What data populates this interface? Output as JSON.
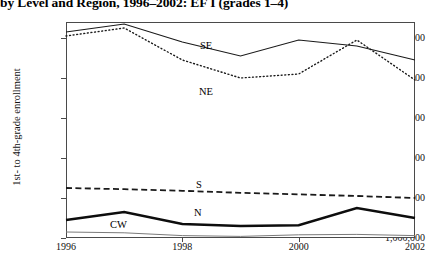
{
  "title": "by Level and Region, 1996–2002: EF I (grades 1–4)",
  "axis": {
    "ylabel": "1st- to 4th-grade enrollment",
    "xlabel": ""
  },
  "ticks": {
    "y": [
      "1,000,000",
      "2,000,000",
      "3,000,000",
      "4,000,000",
      "5,000,000",
      "6,000,000"
    ],
    "x": [
      "1996",
      "1998",
      "2000",
      "2002"
    ]
  },
  "series_labels": {
    "se": "SE",
    "ne": "NE",
    "s": "S",
    "n": "N",
    "cw": "CW"
  },
  "chart_data": {
    "type": "line",
    "title": "by Level and Region, 1996–2002: EF I (grades 1–4)",
    "xlabel": "",
    "ylabel": "1st- to 4th-grade enrollment",
    "x": [
      1996,
      1997,
      1998,
      1999,
      2000,
      2001,
      2002
    ],
    "xlim": [
      1996,
      2002
    ],
    "ylim": [
      1000000,
      6400000
    ],
    "xticks": [
      1996,
      1998,
      2000,
      2002
    ],
    "yticks": [
      1000000,
      2000000,
      3000000,
      4000000,
      5000000,
      6000000
    ],
    "grid": false,
    "legend": "inline-labels",
    "series": [
      {
        "name": "SE",
        "style": "solid",
        "color": "#1a1a1a",
        "width": 1.2,
        "values": [
          6150000,
          6350000,
          5900000,
          5550000,
          5950000,
          5800000,
          5450000
        ]
      },
      {
        "name": "NE",
        "style": "dotted",
        "color": "#1a1a1a",
        "width": 1.4,
        "values": [
          6050000,
          6250000,
          5450000,
          5000000,
          5100000,
          5950000,
          4950000
        ]
      },
      {
        "name": "S",
        "style": "dashed",
        "color": "#1a1a1a",
        "width": 1.8,
        "values": [
          2250000,
          2220000,
          2180000,
          2130000,
          2090000,
          2050000,
          2000000
        ]
      },
      {
        "name": "N",
        "style": "solid-thick",
        "color": "#0d0d0d",
        "width": 2.4,
        "values": [
          1450000,
          1650000,
          1350000,
          1300000,
          1320000,
          1750000,
          1500000
        ]
      },
      {
        "name": "CW",
        "style": "solid-thin",
        "color": "#7a7a7a",
        "width": 1.0,
        "values": [
          1150000,
          1130000,
          1060000,
          1040000,
          1080000,
          1090000,
          1060000
        ]
      }
    ]
  }
}
